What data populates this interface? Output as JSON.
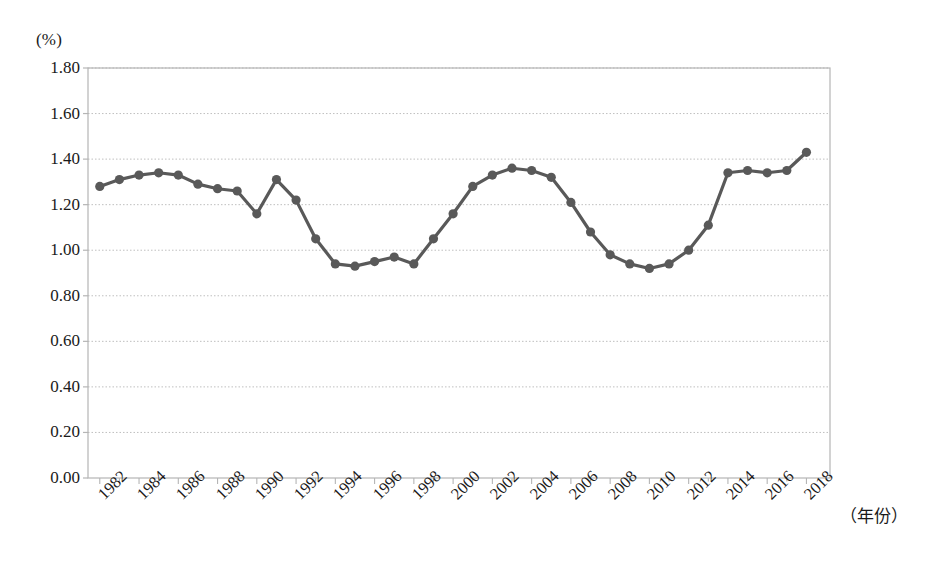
{
  "chart_data": {
    "type": "line",
    "title": "",
    "subtitle": "",
    "xlabel": "（年份）",
    "ylabel": "(%)",
    "unit_label": "(%)",
    "x": [
      1982,
      1983,
      1984,
      1985,
      1986,
      1987,
      1988,
      1989,
      1990,
      1991,
      1992,
      1993,
      1994,
      1995,
      1996,
      1997,
      1998,
      1999,
      2000,
      2001,
      2002,
      2003,
      2004,
      2005,
      2006,
      2007,
      2008,
      2009,
      2010,
      2011,
      2012,
      2013,
      2014,
      2015,
      2016,
      2017,
      2018
    ],
    "values": [
      1.28,
      1.31,
      1.33,
      1.34,
      1.33,
      1.29,
      1.27,
      1.26,
      1.16,
      1.31,
      1.22,
      1.05,
      0.94,
      0.93,
      0.95,
      0.97,
      0.94,
      1.05,
      1.16,
      1.28,
      1.33,
      1.36,
      1.35,
      1.32,
      1.21,
      1.08,
      0.98,
      0.94,
      0.92,
      0.94,
      1.0,
      1.11,
      1.34,
      1.35,
      1.34,
      1.35,
      1.43
    ],
    "series": [
      {
        "name": "比率",
        "color": "#595959",
        "points": [
          {
            "x": 1982,
            "y": 1.28
          },
          {
            "x": 1983,
            "y": 1.31
          },
          {
            "x": 1984,
            "y": 1.33
          },
          {
            "x": 1985,
            "y": 1.34
          },
          {
            "x": 1986,
            "y": 1.33
          },
          {
            "x": 1987,
            "y": 1.29
          },
          {
            "x": 1988,
            "y": 1.27
          },
          {
            "x": 1989,
            "y": 1.26
          },
          {
            "x": 1990,
            "y": 1.16
          },
          {
            "x": 1991,
            "y": 1.31
          },
          {
            "x": 1992,
            "y": 1.22
          },
          {
            "x": 1993,
            "y": 1.05
          },
          {
            "x": 1994,
            "y": 0.94
          },
          {
            "x": 1995,
            "y": 0.93
          },
          {
            "x": 1996,
            "y": 0.95
          },
          {
            "x": 1997,
            "y": 0.97
          },
          {
            "x": 1998,
            "y": 0.94
          },
          {
            "x": 1999,
            "y": 1.05
          },
          {
            "x": 2000,
            "y": 1.16
          },
          {
            "x": 2001,
            "y": 1.28
          },
          {
            "x": 2002,
            "y": 1.33
          },
          {
            "x": 2003,
            "y": 1.36
          },
          {
            "x": 2004,
            "y": 1.35
          },
          {
            "x": 2005,
            "y": 1.32
          },
          {
            "x": 2006,
            "y": 1.21
          },
          {
            "x": 2007,
            "y": 1.08
          },
          {
            "x": 2008,
            "y": 0.98
          },
          {
            "x": 2009,
            "y": 0.94
          },
          {
            "x": 2010,
            "y": 0.92
          },
          {
            "x": 2011,
            "y": 0.94
          },
          {
            "x": 2012,
            "y": 1.0
          },
          {
            "x": 2013,
            "y": 1.11
          },
          {
            "x": 2014,
            "y": 1.34
          },
          {
            "x": 2015,
            "y": 1.35
          },
          {
            "x": 2016,
            "y": 1.34
          },
          {
            "x": 2017,
            "y": 1.35
          },
          {
            "x": 2018,
            "y": 1.43
          }
        ]
      }
    ],
    "ylim": [
      0.0,
      1.8
    ],
    "xlim": [
      1981.4,
      2019.2
    ],
    "ytick_values": [
      0.0,
      0.2,
      0.4,
      0.6,
      0.8,
      1.0,
      1.2,
      1.4,
      1.6,
      1.8
    ],
    "ytick_labels": [
      "0.00",
      "0.20",
      "0.40",
      "0.60",
      "0.80",
      "1.00",
      "1.20",
      "1.40",
      "1.60",
      "1.80"
    ],
    "xtick_values": [
      1982,
      1984,
      1986,
      1988,
      1990,
      1992,
      1994,
      1996,
      1998,
      2000,
      2002,
      2004,
      2006,
      2008,
      2010,
      2012,
      2014,
      2016,
      2018
    ],
    "xtick_labels": [
      "1982",
      "1984",
      "1986",
      "1988",
      "1990",
      "1992",
      "1994",
      "1996",
      "1998",
      "2000",
      "2002",
      "2004",
      "2006",
      "2008",
      "2010",
      "2012",
      "2014",
      "2016",
      "2018"
    ],
    "grid": {
      "horizontal": true,
      "vertical": false,
      "color": "#bfbfbf",
      "style": "dotted"
    },
    "legend": {
      "visible": false,
      "position": "none"
    },
    "marker": {
      "shape": "circle",
      "size": 7,
      "color": "#595959"
    },
    "line": {
      "width": 3.2,
      "color": "#595959"
    },
    "axis_color": "#b5b5b5",
    "frame": {
      "left": true,
      "right": true,
      "top": true,
      "bottom": true
    }
  }
}
